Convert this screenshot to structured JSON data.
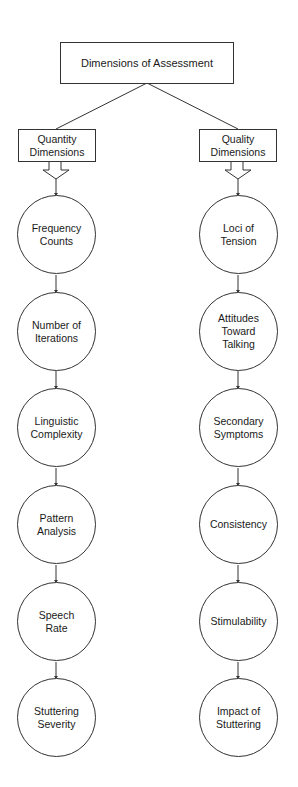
{
  "title": "Dimensions of Assessment",
  "branches": [
    {
      "label": "Quantity\nDimensions",
      "items": [
        "Frequency\nCounts",
        "Number of\nIterations",
        "Linguistic\nComplexity",
        "Pattern\nAnalysis",
        "Speech\nRate",
        "Stuttering\nSeverity"
      ]
    },
    {
      "label": "Quality\nDimensions",
      "items": [
        "Loci of\nTension",
        "Attitudes\nToward\nTalking",
        "Secondary\nSymptoms",
        "Consistency",
        "Stimulability",
        "Impact of\nStuttering"
      ]
    }
  ],
  "colors": {
    "stroke": "#333333",
    "text": "#1a1a1a",
    "background": "#ffffff"
  }
}
